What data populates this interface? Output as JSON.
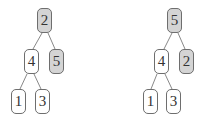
{
  "diagram": {
    "type": "tree-swap",
    "colors": {
      "highlight_fill": "#d4d4d4",
      "normal_fill": "#ffffff",
      "border": "#6e6e6e",
      "edge": "#7a7a7a"
    },
    "trees": [
      {
        "name": "before",
        "nodes": [
          {
            "id": "root",
            "label": "2",
            "highlighted": true,
            "x": 37,
            "y": 8
          },
          {
            "id": "left",
            "label": "4",
            "highlighted": false,
            "x": 24,
            "y": 49
          },
          {
            "id": "right",
            "label": "5",
            "highlighted": true,
            "x": 49,
            "y": 49
          },
          {
            "id": "left-left",
            "label": "1",
            "highlighted": false,
            "x": 11,
            "y": 89
          },
          {
            "id": "left-right",
            "label": "3",
            "highlighted": false,
            "x": 35,
            "y": 89
          }
        ],
        "edges": [
          [
            "root",
            "left"
          ],
          [
            "root",
            "right"
          ],
          [
            "left",
            "left-left"
          ],
          [
            "left",
            "left-right"
          ]
        ]
      },
      {
        "name": "after",
        "nodes": [
          {
            "id": "root",
            "label": "5",
            "highlighted": true,
            "x": 167,
            "y": 8
          },
          {
            "id": "left",
            "label": "4",
            "highlighted": false,
            "x": 154,
            "y": 49
          },
          {
            "id": "right",
            "label": "2",
            "highlighted": true,
            "x": 179,
            "y": 49
          },
          {
            "id": "left-left",
            "label": "1",
            "highlighted": false,
            "x": 143,
            "y": 89
          },
          {
            "id": "left-right",
            "label": "3",
            "highlighted": false,
            "x": 166,
            "y": 89
          }
        ],
        "edges": [
          [
            "root",
            "left"
          ],
          [
            "root",
            "right"
          ],
          [
            "left",
            "left-left"
          ],
          [
            "left",
            "left-right"
          ]
        ]
      }
    ]
  }
}
